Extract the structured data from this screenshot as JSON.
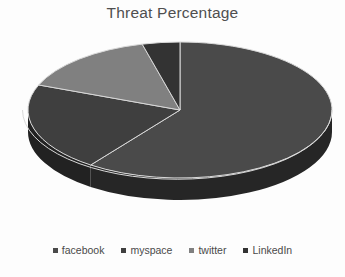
{
  "chart": {
    "title": "Threat Percentage"
  },
  "legend": {
    "position": "bottom",
    "items": [
      {
        "label": "facebook",
        "color": "#4a4a4a"
      },
      {
        "label": "myspace",
        "color": "#3f3f3f"
      },
      {
        "label": "twitter",
        "color": "#808080"
      },
      {
        "label": "LinkedIn",
        "color": "#333333"
      }
    ]
  },
  "chart_data": {
    "type": "pie",
    "title": "Threat Percentage",
    "xlabel": "",
    "ylabel": "",
    "style": "3d-pie",
    "grid": false,
    "legend_position": "bottom",
    "start_angle_deg": 0,
    "direction": "clockwise",
    "categories": [
      "facebook",
      "myspace",
      "twitter",
      "LinkedIn"
    ],
    "values": [
      60,
      21,
      15,
      4
    ],
    "unit": "percent",
    "slice_angles_deg": [
      216,
      75.6,
      54,
      14.4
    ],
    "colors": [
      "#4a4a4a",
      "#3f3f3f",
      "#808080",
      "#333333"
    ],
    "side_wall_colors": [
      "#262626",
      "#222222",
      "#4d4d4d",
      "#1c1c1c"
    ],
    "separator_color": "#d8d8d8"
  }
}
